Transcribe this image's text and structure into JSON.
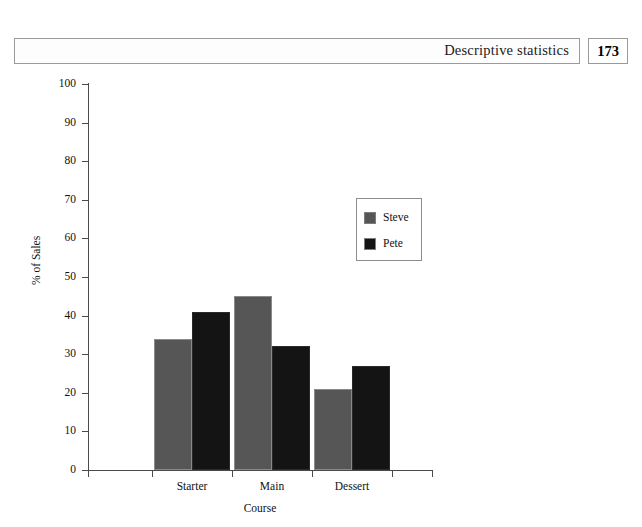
{
  "header": {
    "title": "Descriptive statistics",
    "page_number": "173"
  },
  "chart_data": {
    "type": "bar",
    "title": "",
    "xlabel": "Course",
    "ylabel": "% of Sales",
    "categories": [
      "Starter",
      "Main",
      "Dessert"
    ],
    "series": [
      {
        "name": "Steve",
        "color": "#565656",
        "values": [
          34,
          45,
          21
        ]
      },
      {
        "name": "Pete",
        "color": "#141414",
        "values": [
          41,
          32,
          27
        ]
      }
    ],
    "ylim": [
      0,
      100
    ],
    "yticks": [
      0,
      10,
      20,
      30,
      40,
      50,
      60,
      70,
      80,
      90,
      100
    ],
    "ytick_labels": [
      "0",
      "10",
      "20",
      "30",
      "40",
      "50",
      "60",
      "70",
      "80",
      "90",
      "100"
    ],
    "grid": false,
    "legend_position": "center-right",
    "axis_color": "#4a4a4a"
  }
}
